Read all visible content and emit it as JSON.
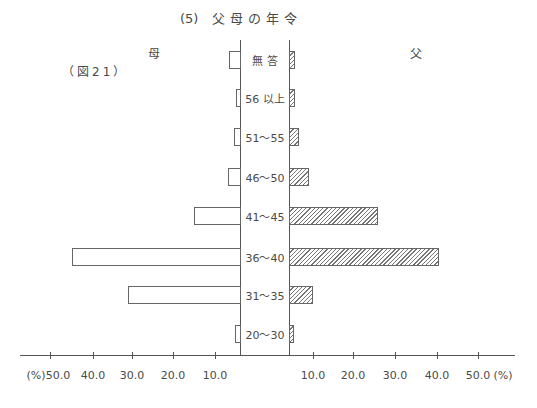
{
  "title": {
    "number": "(5)",
    "text": "父母の年令"
  },
  "figure_label": "（図21）",
  "side_labels": {
    "left": "母",
    "right": "父"
  },
  "chart_data": {
    "type": "bar",
    "orientation": "horizontal-butterfly",
    "figure_label": "（図21）",
    "categories": [
      "無答",
      "56以上",
      "51〜55",
      "46〜50",
      "41〜45",
      "36〜40",
      "31〜35",
      "20〜30"
    ],
    "series": [
      {
        "name": "母",
        "side": "left",
        "fill": "white",
        "values": [
          4.4,
          1.6,
          2.4,
          4.8,
          15.0,
          44.6,
          31.0,
          2.0
        ]
      },
      {
        "name": "父",
        "side": "right",
        "fill": "hatched",
        "values": [
          2.5,
          2.5,
          4.2,
          8.3,
          25.7,
          40.5,
          10.0,
          2.1
        ]
      }
    ],
    "xlabel": "(%)",
    "left_ticks": [
      "50.0",
      "40.0",
      "30.0",
      "20.0",
      "10.0"
    ],
    "right_ticks": [
      "10.0",
      "20.0",
      "30.0",
      "40.0",
      "50.0"
    ],
    "xlim": [
      0,
      50
    ],
    "grid": false
  },
  "axis": {
    "left_unit": "(%)",
    "right_unit": "(%)",
    "left_ticks": [
      "50.0",
      "40.0",
      "30.0",
      "20.0",
      "10.0"
    ],
    "right_ticks": [
      "10.0",
      "20.0",
      "30.0",
      "40.0",
      "50.0"
    ]
  },
  "rows": [
    {
      "label": "無 答",
      "mother": 4.4,
      "father": 2.5
    },
    {
      "label": "56 以上",
      "mother": 1.6,
      "father": 2.5
    },
    {
      "label": "51〜55",
      "mother": 2.4,
      "father": 4.2
    },
    {
      "label": "46〜50",
      "mother": 4.8,
      "father": 8.3
    },
    {
      "label": "41〜45",
      "mother": 15.0,
      "father": 25.7
    },
    {
      "label": "36〜40",
      "mother": 44.6,
      "father": 40.5
    },
    {
      "label": "31〜35",
      "mother": 31.0,
      "father": 10.0
    },
    {
      "label": "20〜30",
      "mother": 2.0,
      "father": 2.1
    }
  ]
}
